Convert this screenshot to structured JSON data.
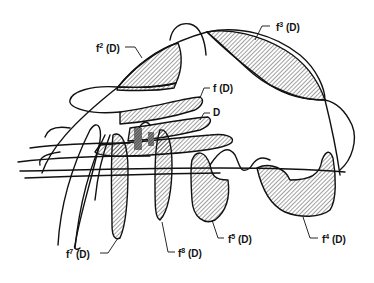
{
  "diagram": {
    "labels": [
      {
        "id": "f2",
        "base": "f",
        "exp": "2",
        "arg": "(D)"
      },
      {
        "id": "f3",
        "base": "f",
        "exp": "3",
        "arg": "(D)"
      },
      {
        "id": "f1",
        "base": "f",
        "exp": "",
        "arg": "(D)"
      },
      {
        "id": "D",
        "base": "D",
        "exp": "",
        "arg": ""
      },
      {
        "id": "f4",
        "base": "f",
        "exp": "4",
        "arg": "(D)"
      },
      {
        "id": "f5",
        "base": "f",
        "exp": "5",
        "arg": "(D)"
      },
      {
        "id": "f7",
        "base": "f",
        "exp": "7",
        "arg": "(D)"
      },
      {
        "id": "f8",
        "base": "f",
        "exp": "8",
        "arg": "(D)"
      }
    ],
    "colors": {
      "ink": "#111111",
      "background": "#ffffff",
      "dense_hatch": "#555555"
    }
  }
}
